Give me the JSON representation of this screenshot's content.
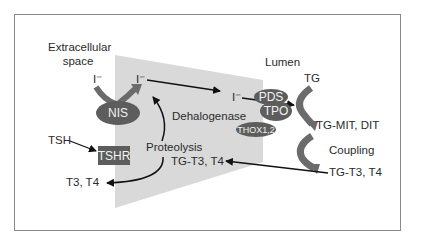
{
  "figure": {
    "type": "thyroid hormone synthesis pathway diagram",
    "colors": {
      "cell_shape": "#d9d9d9",
      "protein_fill": "#5d5d5d",
      "protein_text": "#f2f2f2",
      "arrow": "#111111",
      "curved_arrow": "#6b6b6b",
      "frame_border": "#8a8a8a"
    }
  },
  "regions": {
    "extracellular": "Extracellular space",
    "lumen": "Lumen"
  },
  "proteins": {
    "nis": "NIS",
    "tshr": "TSHR",
    "pds": "PDS",
    "tpo": "TPO",
    "thox": "THOX1,2"
  },
  "labels": {
    "iodide_outside": "I⁻",
    "iodide_cell": "I⁻",
    "iodide_apical": "I⁻",
    "tg": "TG",
    "tg_mit_dit": "TG-MIT, DIT",
    "coupling": "Coupling",
    "tg_t3_t4_lumen": "TG-T3, T4",
    "tg_t3_t4_cell": "TG-T3, T4",
    "dehalogenase": "Dehalogenase",
    "proteolysis": "Proteolysis",
    "tsh": "TSH",
    "t3_t4_out": "T3, T4"
  }
}
